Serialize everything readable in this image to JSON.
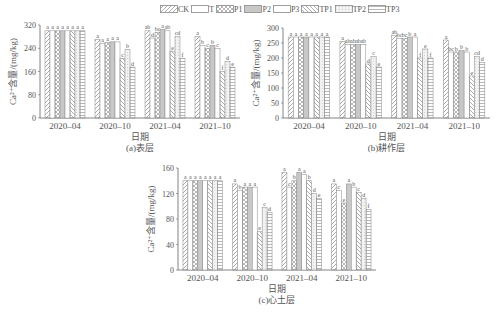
{
  "legend": [
    {
      "name": "CK",
      "pattern": "diag-right"
    },
    {
      "name": "T",
      "pattern": "blank"
    },
    {
      "name": "P1",
      "pattern": "crosshatch"
    },
    {
      "name": "P2",
      "pattern": "gray"
    },
    {
      "name": "P3",
      "pattern": "blank"
    },
    {
      "name": "TP1",
      "pattern": "diag-left"
    },
    {
      "name": "TP2",
      "pattern": "dots"
    },
    {
      "name": "TP3",
      "pattern": "horizontal"
    }
  ],
  "chart_data": [
    {
      "type": "bar",
      "title": "(a)表层",
      "xlabel": "日期",
      "ylabel": "Ca²⁺含量/(mg/kg)",
      "ylim": [
        0,
        320
      ],
      "yticks": [
        0,
        80,
        160,
        240,
        320
      ],
      "categories": [
        "2020-04",
        "2020-10",
        "2021-04",
        "2021-10"
      ],
      "series": [
        {
          "name": "CK",
          "values": [
            300,
            270,
            300,
            280
          ],
          "letters": [
            "a",
            "a",
            "ab",
            "a"
          ]
        },
        {
          "name": "T",
          "values": [
            300,
            257,
            275,
            250
          ],
          "letters": [
            "a",
            "a",
            "d",
            "b"
          ]
        },
        {
          "name": "P1",
          "values": [
            300,
            260,
            295,
            240
          ],
          "letters": [
            "a",
            "a",
            "bc",
            "c"
          ]
        },
        {
          "name": "P2",
          "values": [
            300,
            262,
            305,
            250
          ],
          "letters": [
            "a",
            "a",
            "a",
            "b"
          ]
        },
        {
          "name": "P3",
          "values": [
            300,
            262,
            300,
            240
          ],
          "letters": [
            "a",
            "a",
            "ab",
            "c"
          ]
        },
        {
          "name": "TP1",
          "values": [
            300,
            205,
            230,
            160
          ],
          "letters": [
            "a",
            "c",
            "e",
            "f"
          ]
        },
        {
          "name": "TP2",
          "values": [
            300,
            235,
            280,
            195
          ],
          "letters": [
            "a",
            "b",
            "cd",
            "d"
          ]
        },
        {
          "name": "TP3",
          "values": [
            300,
            175,
            205,
            175
          ],
          "letters": [
            "a",
            "d",
            "f",
            "e"
          ]
        }
      ]
    },
    {
      "type": "bar",
      "title": "(b)耕作层",
      "xlabel": "日期",
      "ylabel": "Ca²⁺含量/(mg/kg)",
      "ylim": [
        0,
        300
      ],
      "yticks": [
        0,
        50,
        100,
        150,
        200,
        250,
        300
      ],
      "categories": [
        "2020-04",
        "2020-10",
        "2021-04",
        "2021-10"
      ],
      "series": [
        {
          "name": "CK",
          "values": [
            270,
            255,
            275,
            260
          ],
          "letters": [
            "a",
            "a",
            "ab",
            "a"
          ]
        },
        {
          "name": "T",
          "values": [
            270,
            245,
            265,
            220
          ],
          "letters": [
            "a",
            "ab",
            "bc",
            "bc"
          ]
        },
        {
          "name": "P1",
          "values": [
            270,
            245,
            265,
            220
          ],
          "letters": [
            "a",
            "ab",
            "bc",
            "b"
          ]
        },
        {
          "name": "P2",
          "values": [
            270,
            245,
            270,
            225
          ],
          "letters": [
            "a",
            "ab",
            "b",
            "b"
          ]
        },
        {
          "name": "P3",
          "values": [
            270,
            245,
            270,
            220
          ],
          "letters": [
            "a",
            "ab",
            "a",
            "b"
          ]
        },
        {
          "name": "TP1",
          "values": [
            270,
            180,
            200,
            140
          ],
          "letters": [
            "a",
            "d",
            "f",
            "e"
          ]
        },
        {
          "name": "TP2",
          "values": [
            270,
            205,
            230,
            205
          ],
          "letters": [
            "a",
            "c",
            "e",
            "cd"
          ]
        },
        {
          "name": "TP3",
          "values": [
            270,
            170,
            200,
            185
          ],
          "letters": [
            "a",
            "e",
            "f",
            "d"
          ]
        }
      ]
    },
    {
      "type": "bar",
      "title": "(c)心土层",
      "xlabel": "日期",
      "ylabel": "Ca²⁺含量/(mg/kg)",
      "ylim": [
        0,
        160
      ],
      "yticks": [
        0,
        40,
        80,
        120,
        160
      ],
      "categories": [
        "2020-04",
        "2020-10",
        "2021-04",
        "2021-10"
      ],
      "series": [
        {
          "name": "CK",
          "values": [
            140,
            135,
            153,
            135
          ],
          "letters": [
            "a",
            "a",
            "a",
            "a"
          ]
        },
        {
          "name": "T",
          "values": [
            140,
            125,
            130,
            125
          ],
          "letters": [
            "a",
            "b",
            "c",
            "c"
          ]
        },
        {
          "name": "P1",
          "values": [
            140,
            130,
            140,
            105
          ],
          "letters": [
            "a",
            "a",
            "b",
            "e"
          ]
        },
        {
          "name": "P2",
          "values": [
            140,
            130,
            153,
            135
          ],
          "letters": [
            "a",
            "a",
            "a",
            "a"
          ]
        },
        {
          "name": "P3",
          "values": [
            140,
            130,
            150,
            130
          ],
          "letters": [
            "a",
            "a",
            "a",
            "b"
          ]
        },
        {
          "name": "TP1",
          "values": [
            140,
            60,
            140,
            122
          ],
          "letters": [
            "a",
            "e",
            "b",
            "c"
          ]
        },
        {
          "name": "TP2",
          "values": [
            140,
            98,
            120,
            112
          ],
          "letters": [
            "a",
            "c",
            "d",
            "d"
          ]
        },
        {
          "name": "TP3",
          "values": [
            140,
            90,
            112,
            95
          ],
          "letters": [
            "a",
            "d",
            "e",
            "f"
          ]
        }
      ]
    }
  ]
}
